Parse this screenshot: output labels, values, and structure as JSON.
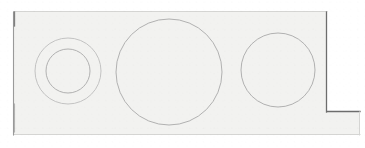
{
  "diagram": {
    "type": "technical-line-drawing",
    "media": "scanned faded blueprint",
    "canvas": {
      "width": 365,
      "height": 148
    },
    "colors": {
      "background": "#ffffff",
      "paper_tint": "#f2f2f0",
      "outline_dark": "#6d6d6d",
      "outline_mid": "#9a9a9a",
      "outline_faint": "#d5d5d3",
      "circle_line": "#a9a9a9"
    },
    "outline": {
      "name": "stepped-rectangular-plate",
      "description": "Rectangular plate with a rectangular step notch cut from the lower right corner",
      "vertices": [
        {
          "x": 14,
          "y": 12
        },
        {
          "x": 327,
          "y": 12
        },
        {
          "x": 327,
          "y": 112
        },
        {
          "x": 360,
          "y": 112
        },
        {
          "x": 360,
          "y": 135
        },
        {
          "x": 14,
          "y": 135
        }
      ],
      "edges": [
        {
          "name": "top-edge",
          "from": [
            14,
            12
          ],
          "to": [
            327,
            12
          ],
          "weight": "faint"
        },
        {
          "name": "right-upper-edge",
          "from": [
            327,
            12
          ],
          "to": [
            327,
            112
          ],
          "weight": "dark"
        },
        {
          "name": "step-horizontal-edge",
          "from": [
            327,
            112
          ],
          "to": [
            360,
            112
          ],
          "weight": "dark"
        },
        {
          "name": "right-lower-edge",
          "from": [
            360,
            112
          ],
          "to": [
            360,
            135
          ],
          "weight": "faint"
        },
        {
          "name": "bottom-edge",
          "from": [
            360,
            135
          ],
          "to": [
            14,
            135
          ],
          "weight": "faint"
        },
        {
          "name": "left-edge",
          "from": [
            14,
            135
          ],
          "to": [
            14,
            12
          ],
          "weight": "mid"
        }
      ]
    },
    "circles": [
      {
        "name": "bore-1-outer",
        "label": "Outer circle of concentric pair (left)",
        "cx": 68,
        "cy": 71,
        "r": 33,
        "diameter": 66,
        "weight": "light"
      },
      {
        "name": "bore-1-inner",
        "label": "Inner circle of concentric pair (left)",
        "cx": 68,
        "cy": 71,
        "r": 22,
        "diameter": 44,
        "weight": "normal"
      },
      {
        "name": "bore-2",
        "label": "Large centre circle",
        "cx": 169,
        "cy": 72,
        "r": 53,
        "diameter": 106,
        "weight": "normal"
      },
      {
        "name": "bore-3",
        "label": "Right circle",
        "cx": 278,
        "cy": 70,
        "r": 37,
        "diameter": 74,
        "weight": "normal"
      }
    ]
  }
}
